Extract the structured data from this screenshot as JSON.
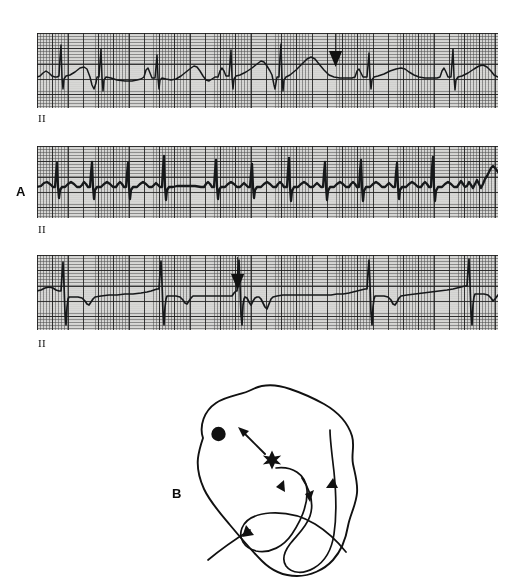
{
  "figure": {
    "panels": [
      {
        "id": "A",
        "label": "A",
        "description": "Three lead II rhythm strips demonstrating premature complexes"
      },
      {
        "id": "B",
        "label": "B",
        "description": "Schematic heart showing ectopic focus with retrograde atrial and antegrade ventricular conduction"
      }
    ]
  },
  "strips": [
    {
      "name": "strip-1",
      "lead_label": "II",
      "marker": {
        "type": "arrow-down",
        "x": 335
      },
      "rhythm": "sinus rhythm with a premature complex marked by arrow"
    },
    {
      "name": "strip-2",
      "lead_label": "II",
      "marker": null,
      "rhythm": "rapid narrow-complex tachycardia"
    },
    {
      "name": "strip-3",
      "lead_label": "II",
      "marker": {
        "type": "arrow-down",
        "x": 237
      },
      "rhythm": "slow rhythm with tall R waves and a premature complex marked by arrow"
    }
  ],
  "heart_diagram": {
    "sinus_node_label": "sinus-node",
    "ectopic_focus_label": "ectopic-focus",
    "arrows": [
      {
        "name": "retrograde-atrial-arrow",
        "direction": "up-left"
      },
      {
        "name": "septal-down-arrow-left",
        "direction": "down"
      },
      {
        "name": "septal-down-arrow-right",
        "direction": "down"
      },
      {
        "name": "lateral-wall-up-arrow",
        "direction": "up"
      },
      {
        "name": "apex-return-arrow",
        "direction": "up-left"
      }
    ]
  },
  "colors": {
    "paper": "#d8d8d6",
    "grid_fine": "#505050",
    "grid_bold": "#1e1e1e",
    "trace": "#16181a",
    "ink": "#111111",
    "background": "#ffffff"
  }
}
